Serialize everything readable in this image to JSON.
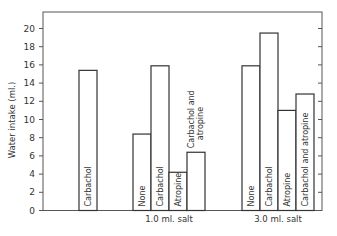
{
  "chart_data": {
    "type": "bar",
    "title": "",
    "xlabel": "",
    "ylabel": "Water intake (ml.)",
    "ylim": [
      0,
      21
    ],
    "yticks": [
      0,
      2,
      4,
      6,
      8,
      10,
      12,
      14,
      16,
      18,
      20
    ],
    "grid": false,
    "groups": [
      {
        "name": "",
        "bars": [
          {
            "label": "Carbachol",
            "value": 15.4
          }
        ]
      },
      {
        "name": "1.0 ml. salt",
        "bars": [
          {
            "label": "None",
            "value": 8.4
          },
          {
            "label": "Carbachol",
            "value": 15.9
          },
          {
            "label": "Atropine",
            "value": 4.2
          },
          {
            "label": "Carbachol and atropine",
            "value": 6.4
          }
        ]
      },
      {
        "name": "3.0 ml. salt",
        "bars": [
          {
            "label": "None",
            "value": 15.9
          },
          {
            "label": "Carbachol",
            "value": 19.5
          },
          {
            "label": "Atropine",
            "value": 11.0
          },
          {
            "label": "Carbachol and atropine",
            "value": 12.8
          }
        ]
      }
    ]
  },
  "labels": {
    "ylabel": "Water intake (ml.)",
    "group1": "1.0 ml. salt",
    "group2": "3.0 ml. salt"
  }
}
